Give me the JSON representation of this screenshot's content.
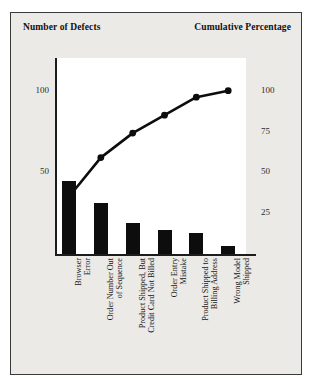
{
  "chart": {
    "type": "pareto",
    "left_axis_title": "Number of\nDefects",
    "right_axis_title": "Cumulative\nPercentage",
    "left_ticks": [
      "100",
      "50"
    ],
    "right_ticks": [
      "100",
      "75",
      "50",
      "25"
    ]
  },
  "chart_data": {
    "type": "bar",
    "title": "",
    "subtitle": "",
    "xlabel": "",
    "ylabel": "Number of Defects",
    "y2label": "Cumulative Percentage",
    "grid": false,
    "legend": "none",
    "ylim": [
      0,
      120
    ],
    "y2lim": [
      0,
      100
    ],
    "yticks": [
      50,
      100
    ],
    "y2ticks": [
      25,
      50,
      75,
      100
    ],
    "categories": [
      "Browser\nError",
      "Order Number Out\nof Sequence",
      "Product Shipped, But\nCredit Card Not Billed",
      "Order Entry\nMistake",
      "Product Shipped to\nBilling Address",
      "Wrong Model\nShipped"
    ],
    "series": [
      {
        "name": "Number of Defects",
        "kind": "bar",
        "axis": "left",
        "values": [
          45,
          31,
          19,
          15,
          13,
          5
        ]
      },
      {
        "name": "Cumulative Percentage",
        "kind": "line",
        "axis": "right",
        "values": [
          35,
          59,
          74,
          85,
          96,
          100
        ]
      }
    ]
  }
}
